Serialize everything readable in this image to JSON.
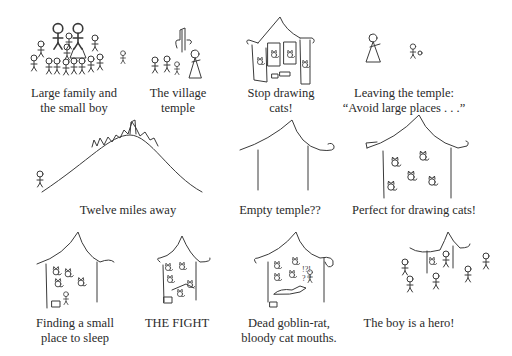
{
  "panels": [
    {
      "id": "p1",
      "caption_lines": [
        "Large family and",
        "the small boy"
      ]
    },
    {
      "id": "p2",
      "caption_lines": [
        "The village",
        "temple"
      ]
    },
    {
      "id": "p3",
      "caption_lines": [
        "Stop drawing",
        "cats!"
      ]
    },
    {
      "id": "p4",
      "caption_lines": [
        "Leaving the temple:",
        "“Avoid large places . . .”"
      ]
    },
    {
      "id": "p5",
      "caption_lines": [
        "Twelve miles away"
      ]
    },
    {
      "id": "p6",
      "caption_lines": [
        "Empty temple??"
      ]
    },
    {
      "id": "p7",
      "caption_lines": [
        "Perfect for drawing cats!"
      ]
    },
    {
      "id": "p8",
      "caption_lines": [
        "Finding a small",
        "place to sleep"
      ]
    },
    {
      "id": "p9",
      "caption_lines": [
        "THE FIGHT"
      ]
    },
    {
      "id": "p10",
      "caption_lines": [
        "Dead goblin-rat,",
        "bloody cat mouths."
      ]
    },
    {
      "id": "p11",
      "caption_lines": [
        "The boy is a hero!"
      ]
    }
  ],
  "icons": {
    "figure": "stick-figure",
    "cat": "cat-sketch",
    "temple": "temple-outline",
    "hill": "hill-with-village"
  }
}
